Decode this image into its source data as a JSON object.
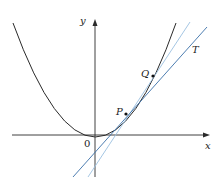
{
  "figure": {
    "type": "tangent-secant-diagram",
    "labels": {
      "y_axis": "y",
      "x_axis": "x",
      "origin": "0",
      "point_p": "P",
      "point_q": "Q",
      "tangent": "T"
    },
    "colors": {
      "curve": "#2a2a2a",
      "axes": "#2a2a2a",
      "tangent_line": "#3a6fa8",
      "secant_line": "#9bbfe0"
    }
  }
}
